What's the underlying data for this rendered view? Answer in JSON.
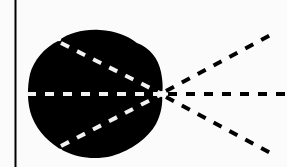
{
  "diagram": {
    "colors": {
      "background": "#fbfbfb",
      "shape_fill": "#000000",
      "inner_dash": "#f2f2f2",
      "outer_dash": "#000000",
      "axis_line": "#000000"
    },
    "apex": {
      "x": 162,
      "y": 94
    },
    "rays_outer": [
      {
        "name": "upper-ray",
        "end": {
          "x": 276,
          "y": 32
        }
      },
      {
        "name": "middle-ray",
        "end": {
          "x": 287,
          "y": 94
        }
      },
      {
        "name": "lower-ray",
        "end": {
          "x": 276,
          "y": 156
        }
      }
    ],
    "rays_inner": [
      {
        "name": "upper-inner",
        "start": {
          "x": 60,
          "y": 40
        }
      },
      {
        "name": "middle-inner",
        "start": {
          "x": 27,
          "y": 94
        }
      },
      {
        "name": "lower-inner",
        "start": {
          "x": 61,
          "y": 150
        }
      }
    ]
  }
}
